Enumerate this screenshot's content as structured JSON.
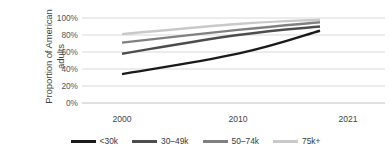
{
  "chart_data": {
    "type": "line",
    "title": "",
    "xlabel": "",
    "ylabel": "Proportion of American adults",
    "categories": [
      "2000",
      "2010",
      "2021"
    ],
    "x": [
      2000,
      2010,
      2021
    ],
    "ylim": [
      0,
      100
    ],
    "yticks": [
      "0%",
      "20%",
      "40%",
      "60%",
      "80%",
      "100%"
    ],
    "ytick_values": [
      0,
      20,
      40,
      60,
      80,
      100
    ],
    "grid": true,
    "legend_position": "bottom",
    "series": [
      {
        "name": "<30k",
        "values": [
          34,
          58,
          85
        ],
        "color": "#1a1a1a"
      },
      {
        "name": "30–49k",
        "values": [
          58,
          80,
          90
        ],
        "color": "#4d4d4d"
      },
      {
        "name": "50–74k",
        "values": [
          71,
          86,
          95
        ],
        "color": "#808080"
      },
      {
        "name": "75k+",
        "values": [
          81,
          93,
          98
        ],
        "color": "#c9c9c9"
      }
    ]
  },
  "axes": {
    "grid_color": "#d9d9d9",
    "tick_color": "#555555"
  }
}
